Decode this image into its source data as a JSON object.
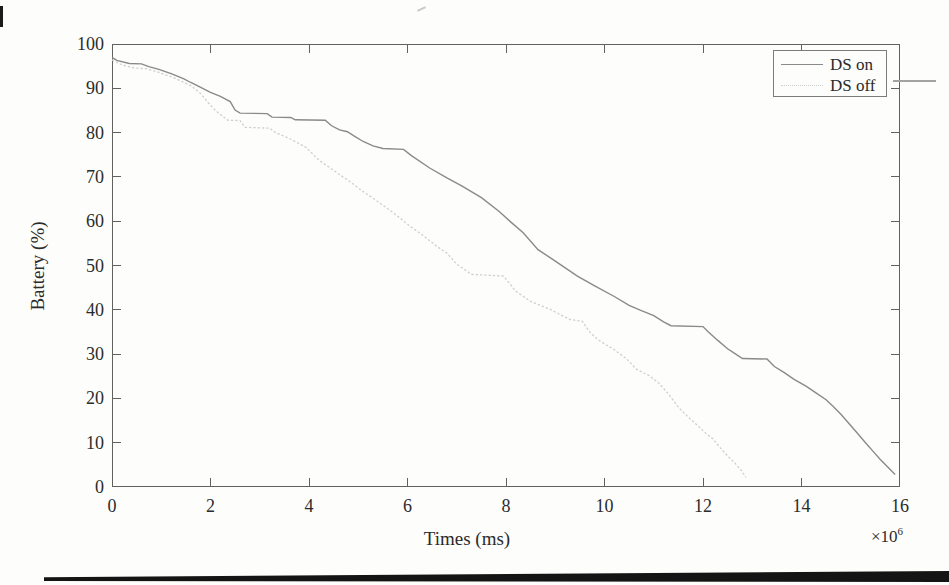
{
  "page": {
    "background": "#fdfdfc"
  },
  "colors": {
    "axis": "#616161",
    "text": "#2b2b2b",
    "ds_on_line": "#8a8a8a",
    "ds_off_line": "#cdd1cc",
    "bottom_rule": "#141414"
  },
  "chart_data": {
    "type": "line",
    "title": "",
    "xlabel": "Times (ms)",
    "ylabel": "Battery (%)",
    "x_multiplier": {
      "base": "×10",
      "exponent": "6"
    },
    "xlim": [
      0,
      16
    ],
    "ylim": [
      0,
      100
    ],
    "x_ticks": [
      0,
      2,
      4,
      6,
      8,
      10,
      12,
      14,
      16
    ],
    "y_ticks": [
      0,
      10,
      20,
      30,
      40,
      50,
      60,
      70,
      80,
      90,
      100
    ],
    "grid": false,
    "legend_position": "top-right",
    "series": [
      {
        "name": "DS on",
        "style": "solid",
        "color": "#8a8a8a",
        "points": [
          [
            0,
            97
          ],
          [
            0.1,
            96.3
          ],
          [
            0.35,
            95.6
          ],
          [
            0.6,
            95.5
          ],
          [
            0.75,
            94.9
          ],
          [
            0.95,
            94.3
          ],
          [
            1.2,
            93.3
          ],
          [
            1.45,
            92.2
          ],
          [
            1.6,
            91.3
          ],
          [
            1.8,
            90.2
          ],
          [
            2.0,
            89.1
          ],
          [
            2.2,
            88.2
          ],
          [
            2.4,
            87.0
          ],
          [
            2.5,
            85.1
          ],
          [
            2.6,
            84.4
          ],
          [
            3.15,
            84.3
          ],
          [
            3.25,
            83.5
          ],
          [
            3.63,
            83.4
          ],
          [
            3.72,
            82.9
          ],
          [
            4.33,
            82.8
          ],
          [
            4.45,
            81.6
          ],
          [
            4.62,
            80.6
          ],
          [
            4.78,
            80.2
          ],
          [
            4.92,
            79.2
          ],
          [
            5.1,
            78.0
          ],
          [
            5.3,
            77.0
          ],
          [
            5.5,
            76.4
          ],
          [
            5.92,
            76.2
          ],
          [
            6.08,
            74.8
          ],
          [
            6.45,
            72.0
          ],
          [
            6.8,
            69.8
          ],
          [
            7.1,
            68.0
          ],
          [
            7.5,
            65.3
          ],
          [
            7.85,
            62.3
          ],
          [
            8.1,
            59.8
          ],
          [
            8.35,
            57.4
          ],
          [
            8.65,
            53.6
          ],
          [
            9.0,
            51.0
          ],
          [
            9.45,
            47.6
          ],
          [
            9.8,
            45.4
          ],
          [
            10.2,
            43.0
          ],
          [
            10.5,
            41.0
          ],
          [
            10.75,
            39.8
          ],
          [
            11.0,
            38.7
          ],
          [
            11.2,
            37.3
          ],
          [
            11.35,
            36.4
          ],
          [
            12.0,
            36.2
          ],
          [
            12.1,
            35.1
          ],
          [
            12.3,
            33.1
          ],
          [
            12.5,
            31.2
          ],
          [
            12.65,
            30.1
          ],
          [
            12.8,
            29.0
          ],
          [
            13.3,
            28.9
          ],
          [
            13.45,
            27.2
          ],
          [
            13.65,
            25.8
          ],
          [
            13.85,
            24.3
          ],
          [
            14.1,
            22.7
          ],
          [
            14.3,
            21.2
          ],
          [
            14.5,
            19.7
          ],
          [
            14.65,
            18.1
          ],
          [
            14.8,
            16.4
          ],
          [
            14.95,
            14.5
          ],
          [
            15.1,
            12.6
          ],
          [
            15.3,
            10.0
          ],
          [
            15.45,
            8.1
          ],
          [
            15.6,
            6.2
          ],
          [
            15.75,
            4.5
          ],
          [
            15.9,
            2.8
          ]
        ]
      },
      {
        "name": "DS off",
        "style": "dotted",
        "color": "#cdd1cc",
        "points": [
          [
            0,
            96.4
          ],
          [
            0.2,
            95.3
          ],
          [
            0.45,
            94.6
          ],
          [
            0.7,
            94.4
          ],
          [
            0.95,
            93.6
          ],
          [
            1.25,
            92.4
          ],
          [
            1.6,
            90.6
          ],
          [
            1.8,
            88.8
          ],
          [
            1.95,
            86.8
          ],
          [
            2.1,
            85.0
          ],
          [
            2.28,
            83.4
          ],
          [
            2.35,
            82.8
          ],
          [
            2.6,
            82.7
          ],
          [
            2.7,
            81.2
          ],
          [
            3.2,
            81.0
          ],
          [
            3.32,
            80.0
          ],
          [
            3.6,
            78.7
          ],
          [
            3.8,
            77.5
          ],
          [
            3.95,
            76.6
          ],
          [
            4.15,
            74.3
          ],
          [
            4.3,
            73.0
          ],
          [
            4.5,
            71.5
          ],
          [
            4.65,
            70.3
          ],
          [
            4.85,
            68.8
          ],
          [
            5.0,
            67.5
          ],
          [
            5.15,
            66.3
          ],
          [
            5.35,
            64.8
          ],
          [
            5.5,
            63.6
          ],
          [
            5.7,
            62.0
          ],
          [
            5.85,
            60.7
          ],
          [
            6.0,
            59.3
          ],
          [
            6.15,
            58.1
          ],
          [
            6.3,
            56.9
          ],
          [
            6.45,
            55.6
          ],
          [
            6.6,
            54.3
          ],
          [
            6.8,
            52.8
          ],
          [
            7.0,
            50.3
          ],
          [
            7.12,
            49.4
          ],
          [
            7.3,
            48.0
          ],
          [
            7.95,
            47.6
          ],
          [
            8.2,
            44.2
          ],
          [
            8.5,
            41.9
          ],
          [
            8.7,
            41.0
          ],
          [
            8.9,
            40.1
          ],
          [
            9.1,
            38.9
          ],
          [
            9.3,
            37.8
          ],
          [
            9.55,
            37.4
          ],
          [
            9.7,
            35.0
          ],
          [
            9.85,
            33.4
          ],
          [
            10.0,
            32.3
          ],
          [
            10.2,
            31.0
          ],
          [
            10.45,
            28.9
          ],
          [
            10.65,
            26.6
          ],
          [
            10.9,
            25.2
          ],
          [
            11.1,
            23.5
          ],
          [
            11.3,
            21.0
          ],
          [
            11.5,
            18.0
          ],
          [
            11.7,
            15.8
          ],
          [
            11.9,
            13.8
          ],
          [
            12.05,
            12.2
          ],
          [
            12.2,
            10.9
          ],
          [
            12.35,
            8.9
          ],
          [
            12.5,
            7.0
          ],
          [
            12.65,
            5.4
          ],
          [
            12.78,
            3.7
          ],
          [
            12.87,
            2.2
          ]
        ]
      }
    ]
  }
}
